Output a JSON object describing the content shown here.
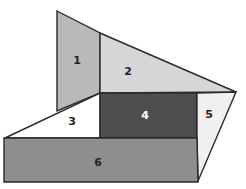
{
  "diagram": {
    "regions": [
      {
        "id": "1",
        "label": "1",
        "fill": "#b9b9b9",
        "text_color": "#222222",
        "points": "57,11 100,33 100,93 57,111",
        "label_pos": [
          77,
          61
        ]
      },
      {
        "id": "2",
        "label": "2",
        "fill": "#d6d6d6",
        "text_color": "#222222",
        "points": "100,33 236,92 100,93",
        "label_pos": [
          128,
          72
        ]
      },
      {
        "id": "3",
        "label": "3",
        "fill": "#ffffff",
        "text_color": "#222222",
        "points": "5,138 100,93 100,138",
        "label_pos": [
          72,
          122
        ]
      },
      {
        "id": "4",
        "label": "4",
        "fill": "#4e4e4e",
        "text_color": "#ffffff",
        "points": "100,93 197,93 197,138 100,138",
        "label_pos": [
          145,
          116
        ]
      },
      {
        "id": "5",
        "label": "5",
        "fill": "#f0f0f0",
        "text_color": "#222222",
        "points": "197,93 236,92 198,181 197,138",
        "label_pos": [
          209,
          115
        ]
      },
      {
        "id": "6",
        "label": "6",
        "fill": "#8e8e8e",
        "text_color": "#222222",
        "points": "4,138 197,138 198,182 4,182",
        "label_pos": [
          98,
          163
        ]
      }
    ],
    "stroke": "#2a2a2a"
  }
}
